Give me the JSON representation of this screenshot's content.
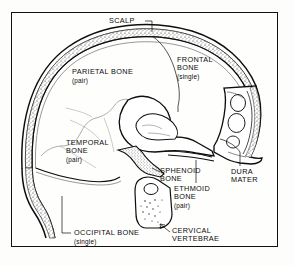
{
  "figure": {
    "frame_color": "#121212",
    "background_color": "#fefefd",
    "ink_color": "#0b0b0b"
  },
  "labels": {
    "scalp": {
      "name": "SCALP",
      "qualifier": ""
    },
    "frontal_bone": {
      "name": "FRONTAL\nBONE",
      "qualifier": "(single)"
    },
    "parietal_bone": {
      "name": "PARIETAL BONE",
      "qualifier": "(pair)"
    },
    "temporal_bone": {
      "name": "TEMPORAL\nBONE",
      "qualifier": "(pair)"
    },
    "sphenoid_bone": {
      "name": "SPHENOID\nBONE",
      "qualifier": ""
    },
    "ethmoid_bone": {
      "name": "ETHMOID\nBONE",
      "qualifier": "(pair)"
    },
    "dura_mater": {
      "name": "DURA\nMATER",
      "qualifier": ""
    },
    "occipital_bone": {
      "name": "OCCIPITAL BONE",
      "qualifier": "(single)"
    },
    "cervical_vertebrae": {
      "name": "CERVICAL\nVERTEBRAE",
      "qualifier": ""
    }
  },
  "structures": [
    "cranial-vault",
    "scalp-layer",
    "diploe-layer",
    "inner-table",
    "frontal-sinus",
    "sphenoid-body",
    "ethmoid-region",
    "temporal-bone-region",
    "occipital-bone",
    "cervical-vertebra"
  ]
}
